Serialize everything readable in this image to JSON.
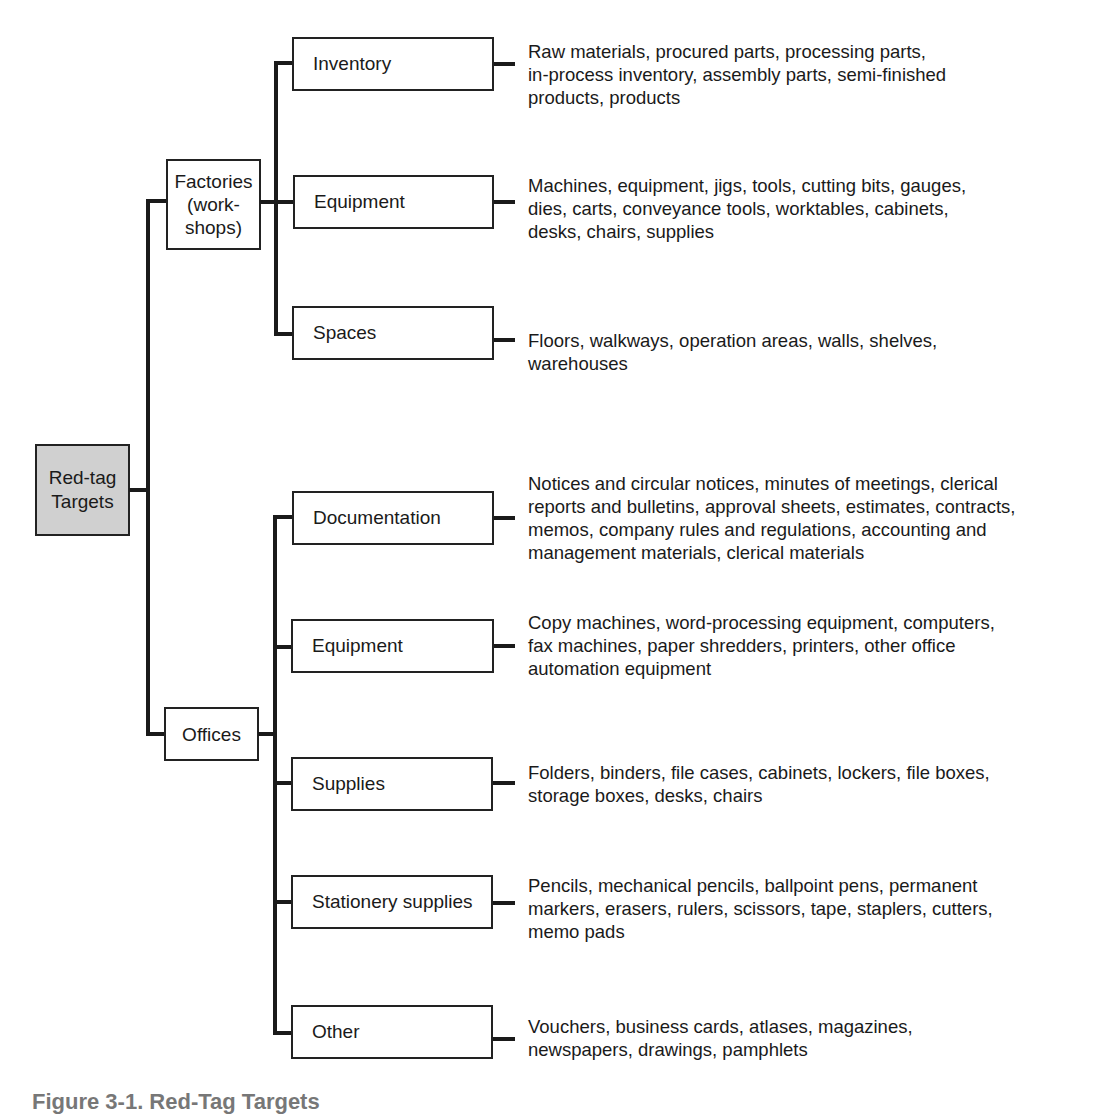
{
  "root": {
    "label_line1": "Red-tag",
    "label_line2": "Targets"
  },
  "branches": [
    {
      "label_lines": [
        "Factories",
        "(work-",
        "shops)"
      ],
      "children": [
        {
          "label": "Inventory",
          "desc": [
            "Raw materials, procured parts, processing parts,",
            "in-process inventory, assembly parts, semi-finished",
            "products, products"
          ]
        },
        {
          "label": "Equipment",
          "desc": [
            "Machines, equipment, jigs, tools, cutting bits, gauges,",
            "dies, carts, conveyance tools, worktables, cabinets,",
            "desks, chairs, supplies"
          ]
        },
        {
          "label": "Spaces",
          "desc": [
            "Floors, walkways, operation areas, walls, shelves,",
            "warehouses"
          ]
        }
      ]
    },
    {
      "label_lines": [
        "Offices"
      ],
      "children": [
        {
          "label": "Documentation",
          "desc": [
            "Notices and circular notices, minutes of meetings, clerical",
            "reports and bulletins, approval sheets, estimates, contracts,",
            "memos, company rules and regulations, accounting and",
            "management materials, clerical materials"
          ]
        },
        {
          "label": "Equipment",
          "desc": [
            "Copy machines, word-processing equipment, computers,",
            "fax machines, paper shredders, printers, other office",
            "automation equipment"
          ]
        },
        {
          "label": "Supplies",
          "desc": [
            "Folders, binders, file cases, cabinets, lockers, file boxes,",
            "storage boxes, desks, chairs"
          ]
        },
        {
          "label": "Stationery supplies",
          "desc": [
            "Pencils, mechanical pencils, ballpoint pens, permanent",
            "markers, erasers, rulers, scissors, tape, staplers, cutters,",
            "memo pads"
          ]
        },
        {
          "label": "Other",
          "desc": [
            "Vouchers, business cards, atlases, magazines,",
            "newspapers, drawings, pamphlets"
          ]
        }
      ]
    }
  ],
  "caption": "Figure 3-1. Red-Tag Targets",
  "colors": {
    "root_fill": "#d0d0d0",
    "line": "#1a1a1a"
  }
}
